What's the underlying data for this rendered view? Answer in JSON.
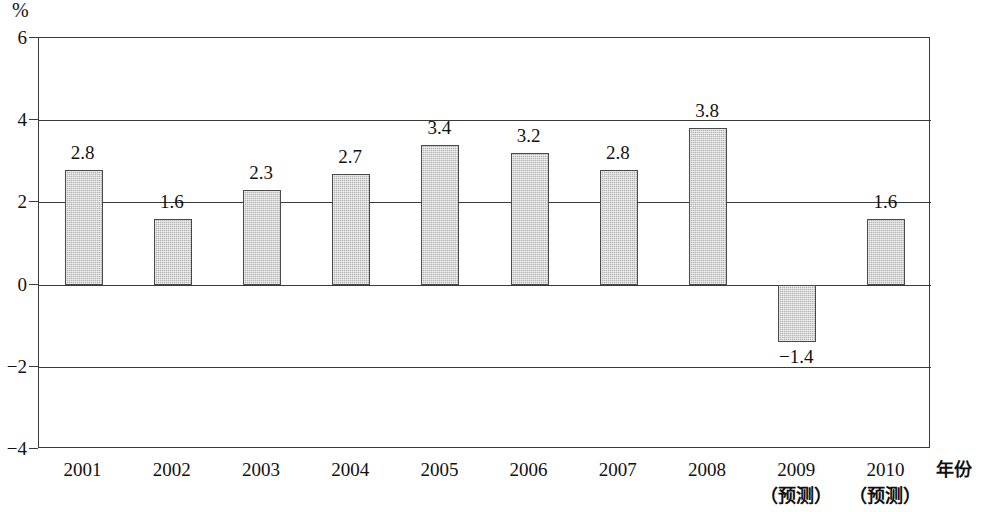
{
  "chart_data": {
    "type": "bar",
    "title": "",
    "subtitle": "",
    "xlabel": "年份",
    "ylabel": "%",
    "categories": [
      "2001",
      "2002",
      "2003",
      "2004",
      "2005",
      "2006",
      "2007",
      "2008",
      "2009",
      "2010"
    ],
    "category_sublabels": [
      "",
      "",
      "",
      "",
      "",
      "",
      "",
      "",
      "（预测）",
      "（预测）"
    ],
    "values": [
      2.8,
      1.6,
      2.3,
      2.7,
      3.4,
      3.2,
      2.8,
      3.8,
      -1.4,
      1.6
    ],
    "value_labels": [
      "2.8",
      "1.6",
      "2.3",
      "2.7",
      "3.4",
      "3.2",
      "2.8",
      "3.8",
      "−1.4",
      "1.6"
    ],
    "ylim": [
      -4,
      6
    ],
    "ytick_labels": [
      "6",
      "4",
      "2",
      "0",
      "−2",
      "−4"
    ],
    "ytick_values": [
      6,
      4,
      2,
      0,
      -2,
      -4
    ],
    "grid": true,
    "legend": "none",
    "bar_fill_color": "#b4b4b4",
    "bar_border_color": "#4a4a4a",
    "axis_color": "#3a3a3a",
    "background_color": "#ffffff"
  }
}
